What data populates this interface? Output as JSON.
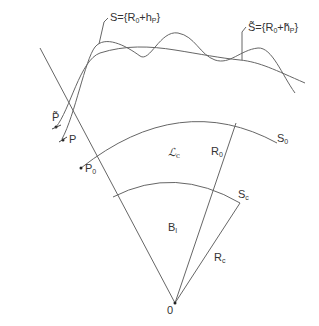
{
  "diagram": {
    "labels": {
      "surface_S": "S={R",
      "surface_S_sub0": "0",
      "surface_S_mid": "+h",
      "surface_S_subP": "P",
      "surface_S_end": "}",
      "surface_S_tilde": "S̃={R",
      "surface_S_tilde_sub0": "0",
      "surface_S_tilde_mid": "+h̃",
      "surface_S_tilde_subP": "P",
      "surface_S_tilde_end": "}",
      "point_P_tilde": "P̃",
      "point_P": "P",
      "point_P0": "P",
      "point_P0_sub": "0",
      "sphere_S0": "S",
      "sphere_S0_sub": "0",
      "sphere_Sc": "S",
      "sphere_Sc_sub": "c",
      "region_Lc": "ℒ",
      "region_Lc_sub": "c",
      "radius_R0": "R",
      "radius_R0_sub": "0",
      "radius_Rc": "R",
      "radius_Rc_sub": "c",
      "ball_B": "B",
      "ball_B_sub": "I",
      "origin": "0"
    },
    "colors": {
      "line": "#555555",
      "text": "#333333"
    }
  }
}
